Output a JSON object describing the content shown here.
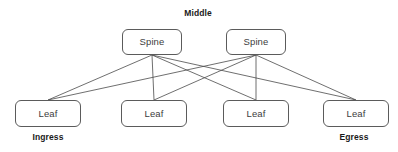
{
  "diagram": {
    "type": "spine-leaf-network-topology",
    "canvas": {
      "width": 398,
      "height": 152,
      "background": "#ffffff"
    },
    "style": {
      "line_color": "#4a4a4a",
      "line_width": 0.8,
      "box_border_color": "#5b5b5b",
      "box_fill": "#ffffff",
      "box_text_color": "#3d3d3d",
      "zone_label_color": "#1a1a1a"
    },
    "zone_labels": {
      "middle": "Middle",
      "ingress": "Ingress",
      "egress": "Egress"
    },
    "spines": [
      {
        "id": "spine-0",
        "label": "Spine",
        "x": 122,
        "y": 29,
        "w": 60,
        "h": 26,
        "port_x": 152,
        "port_y": 55
      },
      {
        "id": "spine-1",
        "label": "Spine",
        "x": 226,
        "y": 29,
        "w": 60,
        "h": 26,
        "port_x": 256,
        "port_y": 55
      }
    ],
    "leaves": [
      {
        "id": "leaf-0",
        "label": "Leaf",
        "x": 15,
        "y": 100,
        "w": 66,
        "h": 27,
        "port_x": 48,
        "port_y": 100
      },
      {
        "id": "leaf-1",
        "label": "Leaf",
        "x": 121,
        "y": 100,
        "w": 66,
        "h": 27,
        "port_x": 154,
        "port_y": 100
      },
      {
        "id": "leaf-2",
        "label": "Leaf",
        "x": 223,
        "y": 100,
        "w": 66,
        "h": 27,
        "port_x": 256,
        "port_y": 100
      },
      {
        "id": "leaf-3",
        "label": "Leaf",
        "x": 323,
        "y": 100,
        "w": 66,
        "h": 27,
        "port_x": 356,
        "port_y": 100
      }
    ],
    "links": [
      {
        "from": "spine-0",
        "to": "leaf-0"
      },
      {
        "from": "spine-0",
        "to": "leaf-1"
      },
      {
        "from": "spine-0",
        "to": "leaf-2"
      },
      {
        "from": "spine-0",
        "to": "leaf-3"
      },
      {
        "from": "spine-1",
        "to": "leaf-0"
      },
      {
        "from": "spine-1",
        "to": "leaf-1"
      },
      {
        "from": "spine-1",
        "to": "leaf-2"
      },
      {
        "from": "spine-1",
        "to": "leaf-3"
      }
    ]
  }
}
